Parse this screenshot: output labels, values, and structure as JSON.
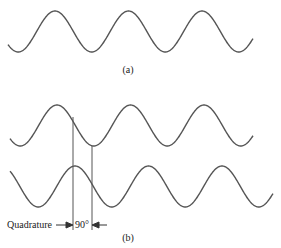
{
  "figure": {
    "panel_a": {
      "label": "(a)",
      "wave": {
        "x_start": 8,
        "x_end": 253,
        "peak_y": 11,
        "trough_y": 52,
        "period": 73.5,
        "first_peak_x": 55
      }
    },
    "panel_b": {
      "label": "(b)",
      "top_wave": {
        "x_start": 10,
        "x_end": 253,
        "peak_y": 105,
        "trough_y": 146,
        "period": 73.5,
        "first_peak_x": 57
      },
      "bottom_wave": {
        "x_start": 10,
        "x_end": 273,
        "peak_y": 166,
        "trough_y": 207,
        "period": 73.5,
        "first_peak_x": 75
      },
      "marker_lines": [
        {
          "x": 73,
          "y1": 117,
          "y2": 230
        },
        {
          "x": 92,
          "y1": 146,
          "y2": 230
        }
      ],
      "quadrature_label": "Quadrature",
      "phase_label": "90°"
    },
    "colors": {
      "stroke": "#555555",
      "text": "#222222",
      "background": "#ffffff"
    }
  }
}
